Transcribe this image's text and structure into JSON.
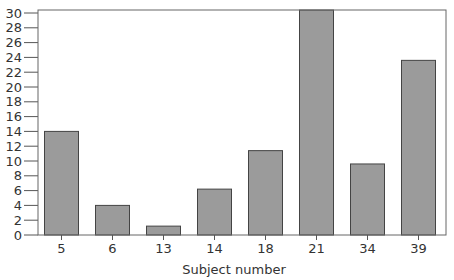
{
  "chart_data": {
    "type": "bar",
    "title": "",
    "xlabel": "Subject number",
    "ylabel": "",
    "categories": [
      "5",
      "6",
      "13",
      "14",
      "18",
      "21",
      "34",
      "39"
    ],
    "values": [
      14,
      4,
      1.2,
      6.2,
      11.4,
      30.4,
      9.6,
      23.6
    ],
    "ylim": [
      0,
      30
    ],
    "yticks": [
      0,
      2,
      4,
      6,
      8,
      10,
      12,
      14,
      16,
      18,
      20,
      22,
      24,
      26,
      28,
      30
    ],
    "grid": false,
    "legend": null,
    "colors": {
      "bar_fill": "#9b9b9b",
      "bar_stroke": "#444444",
      "axis": "#555555"
    }
  }
}
